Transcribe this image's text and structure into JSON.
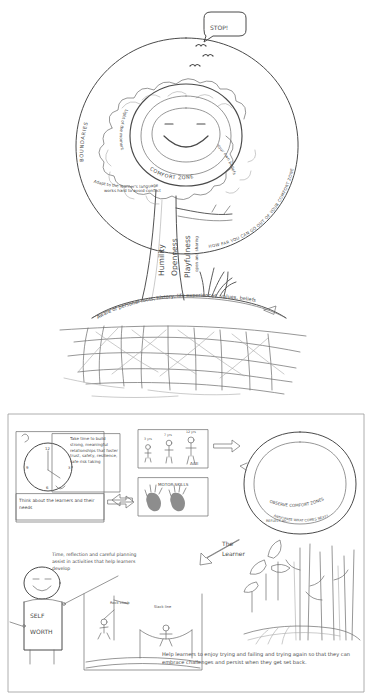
{
  "document": {
    "title": "The Practitioner and The Learner",
    "medium": "hand-drawn pencil sketch",
    "ink_color": "#4a4a4a",
    "background_color": "#ffffff"
  },
  "panel_top": {
    "name": "practitioner-tree",
    "figure_label": "The Practitioner",
    "speech_bubble": "STOP!",
    "outer_ring_left_label": "BOUNDARIES",
    "outer_ring_right_label": "HOW FAR YOU CAN GO OUT OF YOUR COMFORT ZONE",
    "centre_label": "COMFORT ZONE",
    "centre_face": "smiley-face",
    "cloud_labels": [
      "Light of the moment",
      "Your own beliefs",
      "Adapt to the learner's language",
      "works hard to avoid conflict"
    ],
    "trunk_words": [
      "Humility",
      "Openness",
      "Playfulness"
    ],
    "trunk_small_word": "open and sharing",
    "roots_banner": "Aware of personal roots, history, life experiences, values, beliefs"
  },
  "panel_bottom": {
    "name": "learner-process",
    "figure_label": "The Learner",
    "clock_note": "Take time to build strong, meaningful relationships that foster trust, safety, resilience, safe risk taking",
    "clock_caption": "Think about the learners and their needs",
    "age_panel_label": "AGE",
    "age_panel_items": [
      "3 yrs",
      "7 yrs",
      "12 yrs"
    ],
    "motor_skills_label": "MOTOR SKILLS",
    "loop_label_primary": "OBSERVE COMFORT ZONES",
    "loop_label_secondary": "REFLECT on...",
    "loop_label_tertiary": "ANTICIPATE WHAT COMES NEXT?",
    "self_worth_figure": {
      "line1": "SELF",
      "line2": "WORTH"
    },
    "planning_note": "Time, reflection and careful planning assist in activities that help learners develop",
    "activity_labels": [
      "Rock climb",
      "Slack line"
    ],
    "closing_note": "Help learners to enjoy trying and failing and trying again so that they can embrace challenges and persist when they get set back."
  }
}
